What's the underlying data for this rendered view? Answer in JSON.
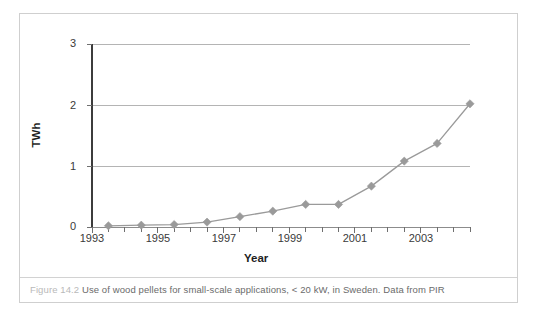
{
  "figure": {
    "caption_number": "Figure 14.2",
    "caption_text": "Use of wood pellets for small-scale applications, < 20 kW, in Sweden.  Data from PIR",
    "border_color": "#cfcfcf"
  },
  "chart_data": {
    "type": "line",
    "title": "",
    "xlabel": "Year",
    "ylabel": "TWh",
    "xlim": [
      1993,
      2004.5
    ],
    "ylim": [
      0,
      3
    ],
    "grid": "horizontal",
    "legend": "none",
    "series_color": "#9a9a9a",
    "marker": "diamond",
    "x_tick_labels": [
      "1993",
      "1995",
      "1997",
      "1999",
      "2001",
      "2003"
    ],
    "x_tick_values": [
      1993,
      1995,
      1997,
      1999,
      2001,
      2003
    ],
    "x_minor_tick_values": [
      1993.5,
      1994,
      1994.5,
      1995.5,
      1996,
      1996.5,
      1997.5,
      1998,
      1998.5,
      1999.5,
      2000,
      2000.5,
      2001.5,
      2002,
      2002.5,
      2003.5,
      2004,
      2004.5
    ],
    "y_tick_labels": [
      "0",
      "1",
      "2",
      "3"
    ],
    "y_tick_values": [
      0,
      1,
      2,
      3
    ],
    "series": [
      {
        "name": "Wood pellet use, small-scale (< 20 kW), Sweden",
        "x": [
          1993.5,
          1994.5,
          1995.5,
          1996.5,
          1997.5,
          1998.5,
          1999.5,
          2000.5,
          2001.5,
          2002.5,
          2003.5,
          2004.5
        ],
        "values": [
          0.02,
          0.03,
          0.04,
          0.08,
          0.17,
          0.26,
          0.37,
          0.37,
          0.67,
          1.08,
          1.37,
          2.02
        ]
      }
    ]
  }
}
